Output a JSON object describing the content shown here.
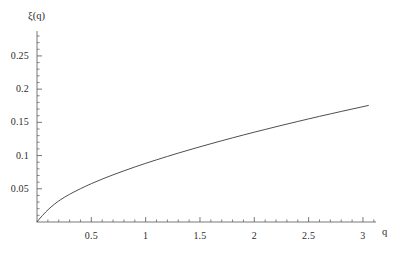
{
  "chart_data": {
    "type": "line",
    "title": "",
    "subtitle": "",
    "xlabel": "q",
    "ylabel": "ξ(q)",
    "xlim": [
      0,
      3.12
    ],
    "ylim": [
      0,
      0.2875
    ],
    "grid": false,
    "legend": null,
    "x_ticks": [
      {
        "value": 0.5,
        "label": "0.5"
      },
      {
        "value": 1,
        "label": "1"
      },
      {
        "value": 1.5,
        "label": "1.5"
      },
      {
        "value": 2,
        "label": "2"
      },
      {
        "value": 2.5,
        "label": "2.5"
      },
      {
        "value": 3,
        "label": "3"
      }
    ],
    "y_ticks": [
      {
        "value": 0.05,
        "label": "0.05"
      },
      {
        "value": 0.1,
        "label": "0.1"
      },
      {
        "value": 0.15,
        "label": "0.15"
      },
      {
        "value": 0.2,
        "label": "0.2"
      },
      {
        "value": 0.25,
        "label": "0.25"
      }
    ],
    "x_minor_step": 0.1,
    "y_minor_step": 0.01,
    "series": [
      {
        "name": "ξ(q)",
        "color": "#3a3a3a",
        "width": 0.9,
        "x": [
          0,
          0.02,
          0.05,
          0.08,
          0.12,
          0.16,
          0.2,
          0.25,
          0.3,
          0.35,
          0.4,
          0.45,
          0.5,
          0.6,
          0.7,
          0.8,
          0.9,
          1.0,
          1.1,
          1.2,
          1.3,
          1.4,
          1.5,
          1.6,
          1.7,
          1.8,
          1.9,
          2.0,
          2.1,
          2.2,
          2.3,
          2.4,
          2.5,
          2.6,
          2.7,
          2.8,
          2.9,
          3.0,
          3.05
        ],
        "y": [
          0,
          0.0042,
          0.0098,
          0.015,
          0.0213,
          0.0268,
          0.0317,
          0.037,
          0.0417,
          0.046,
          0.0501,
          0.054,
          0.0577,
          0.0646,
          0.071,
          0.077,
          0.0828,
          0.0883,
          0.0936,
          0.0987,
          0.1037,
          0.1085,
          0.1132,
          0.1178,
          0.1223,
          0.1267,
          0.131,
          0.1352,
          0.1393,
          0.1434,
          0.1474,
          0.1513,
          0.1552,
          0.159,
          0.1627,
          0.1664,
          0.17,
          0.1736,
          0.1754
        ]
      }
    ],
    "sampled_points": [
      {
        "q": 0.0,
        "xi": 0.0
      },
      {
        "q": 0.25,
        "xi": 0.037
      },
      {
        "q": 0.5,
        "xi": 0.074
      },
      {
        "q": 1.0,
        "xi": 0.115
      },
      {
        "q": 1.5,
        "xi": 0.154
      },
      {
        "q": 2.0,
        "xi": 0.196
      },
      {
        "q": 2.5,
        "xi": 0.237
      },
      {
        "q": 3.0,
        "xi": 0.276
      }
    ],
    "axis_color": "#555555",
    "curve_color": "#3a3a3a"
  }
}
